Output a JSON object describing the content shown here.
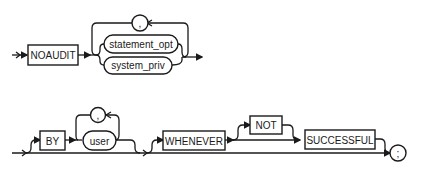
{
  "diagram": {
    "type": "railroad-syntax",
    "statement_1": {
      "keyword": "NOAUDIT",
      "choices": [
        "statement_opt",
        "system_priv"
      ],
      "repeat_separator": ","
    },
    "statement_2": {
      "by_keyword": "BY",
      "user": "user",
      "user_separator": ",",
      "whenever_keyword": "WHENEVER",
      "not_keyword": "NOT",
      "successful_keyword": "SUCCESSFUL",
      "terminator": ";"
    }
  }
}
